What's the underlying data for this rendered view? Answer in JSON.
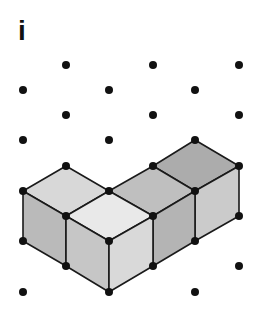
{
  "figure": {
    "label": "i",
    "colors": {
      "background": "#ffffff",
      "dot": "#111111",
      "edge": "#1a1a1a",
      "face_light": "#e6e6e6",
      "face_light_mid": "#d4d4d4",
      "face_mid": "#c3c3c3",
      "face_dark": "#acacac",
      "face_side_left": "#bcbcbc",
      "face_side_right": "#cfcfcf"
    },
    "grid": {
      "type": "isometric-dot-grid",
      "columns_x": [
        23,
        66,
        109,
        153,
        195,
        239
      ],
      "row_step": 25
    },
    "shape": {
      "description": "L-shaped arrangement of four unit cubes on isometric dot paper",
      "cube_count": 4
    }
  }
}
